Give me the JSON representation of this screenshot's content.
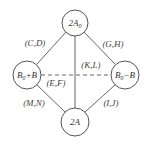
{
  "diagram": {
    "colors": {
      "stroke": "#555555",
      "text": "#333333",
      "background": "#ffffff"
    },
    "nodes": [
      {
        "id": "top",
        "main": "2A",
        "sub": "0",
        "cx": 75,
        "cy": 23,
        "r": 13
      },
      {
        "id": "left",
        "main": "B",
        "sub": "0",
        "tail": "+B",
        "cx": 27,
        "cy": 75,
        "r": 14
      },
      {
        "id": "right",
        "main": "B",
        "sub": "0",
        "tail": "−B",
        "cx": 125,
        "cy": 75,
        "r": 14
      },
      {
        "id": "bottom",
        "main": "2A",
        "sub": "",
        "cx": 75,
        "cy": 122,
        "r": 14
      }
    ],
    "edges": [
      {
        "from": "top",
        "to": "left",
        "label": "(C,D)",
        "style": "solid"
      },
      {
        "from": "top",
        "to": "right",
        "label": "(G,H)",
        "style": "solid"
      },
      {
        "from": "top",
        "to": "bottom",
        "label": "(K,L)",
        "style": "solid"
      },
      {
        "from": "left",
        "to": "right",
        "label": "(E,F)",
        "style": "dashed"
      },
      {
        "from": "left",
        "to": "bottom",
        "label": "(M,N)",
        "style": "solid"
      },
      {
        "from": "right",
        "to": "bottom",
        "label": "(I,J)",
        "style": "solid"
      }
    ]
  }
}
